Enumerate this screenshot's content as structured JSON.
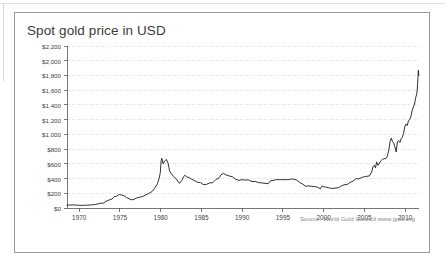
{
  "document": {
    "background_color": "#ffffff",
    "frame_color": "#e2e2e2"
  },
  "card": {
    "border_color": "#9a9a9a",
    "background": "#ffffff"
  },
  "chart_data": {
    "type": "line",
    "title": "Spot gold price in USD",
    "xlabel": "",
    "ylabel": "",
    "source": "Source: World Gold Council www.gold.org",
    "grid": true,
    "grid_color": "#cfcfcf",
    "legend": "none",
    "line_color": "#1a1a1a",
    "axis_color": "#555555",
    "currency_prefix": "$",
    "xlim": [
      1968.5,
      2011.7
    ],
    "ylim": [
      0,
      2200
    ],
    "ytick_labels": [
      "$0",
      "$200",
      "$400",
      "$600",
      "$800",
      "$1,000",
      "$1,200",
      "$1,400",
      "$1,600",
      "$1,800",
      "$2,000",
      "$2,200"
    ],
    "ytick_values": [
      0,
      200,
      400,
      600,
      800,
      1000,
      1200,
      1400,
      1600,
      1800,
      2000,
      2200
    ],
    "xtick_labels": [
      "1970",
      "1975",
      "1980",
      "1985",
      "1990",
      "1995",
      "2000",
      "2005",
      "2010"
    ],
    "xtick_values": [
      1970,
      1975,
      1980,
      1985,
      1990,
      1995,
      2000,
      2005,
      2010
    ],
    "series": [
      {
        "name": "Spot gold price",
        "x": [
          1968.5,
          1969.0,
          1969.5,
          1970.0,
          1970.5,
          1971.0,
          1971.5,
          1972.0,
          1972.5,
          1973.0,
          1973.3,
          1973.6,
          1974.0,
          1974.3,
          1974.6,
          1974.9,
          1975.2,
          1975.5,
          1975.8,
          1976.1,
          1976.4,
          1976.7,
          1977.0,
          1977.4,
          1977.8,
          1978.2,
          1978.6,
          1979.0,
          1979.3,
          1979.6,
          1979.8,
          1979.95,
          1980.05,
          1980.15,
          1980.3,
          1980.5,
          1980.7,
          1980.9,
          1981.1,
          1981.4,
          1981.7,
          1982.0,
          1982.3,
          1982.6,
          1982.8,
          1983.0,
          1983.2,
          1983.5,
          1983.8,
          1984.1,
          1984.5,
          1984.9,
          1985.2,
          1985.6,
          1986.0,
          1986.4,
          1986.8,
          1987.1,
          1987.4,
          1987.7,
          1988.0,
          1988.4,
          1988.8,
          1989.2,
          1989.6,
          1990.0,
          1990.4,
          1990.8,
          1991.2,
          1991.6,
          1992.0,
          1992.4,
          1992.8,
          1993.2,
          1993.5,
          1993.8,
          1994.2,
          1994.6,
          1995.0,
          1995.4,
          1995.8,
          1996.0,
          1996.3,
          1996.7,
          1997.0,
          1997.4,
          1997.8,
          1998.1,
          1998.5,
          1998.9,
          1999.2,
          1999.6,
          1999.8,
          1999.95,
          2000.2,
          2000.6,
          2001.0,
          2001.4,
          2001.8,
          2002.1,
          2002.5,
          2002.9,
          2003.2,
          2003.6,
          2004.0,
          2004.3,
          2004.7,
          2005.0,
          2005.3,
          2005.6,
          2005.9,
          2006.05,
          2006.2,
          2006.35,
          2006.5,
          2006.65,
          2006.8,
          2007.0,
          2007.2,
          2007.4,
          2007.6,
          2007.8,
          2008.0,
          2008.15,
          2008.3,
          2008.45,
          2008.6,
          2008.75,
          2008.9,
          2009.05,
          2009.2,
          2009.35,
          2009.5,
          2009.65,
          2009.8,
          2009.95,
          2010.1,
          2010.25,
          2010.4,
          2010.55,
          2010.7,
          2010.85,
          2011.0,
          2011.15,
          2011.3,
          2011.45,
          2011.55,
          2011.62,
          2011.68
        ],
        "y": [
          38,
          41,
          41,
          36,
          36,
          39,
          42,
          48,
          62,
          68,
          92,
          106,
          120,
          155,
          160,
          183,
          176,
          166,
          142,
          128,
          112,
          116,
          134,
          146,
          157,
          180,
          200,
          230,
          275,
          330,
          400,
          480,
          640,
          675,
          600,
          640,
          660,
          610,
          500,
          450,
          420,
          380,
          335,
          375,
          425,
          445,
          420,
          415,
          390,
          375,
          350,
          345,
          320,
          320,
          340,
          345,
          390,
          400,
          450,
          470,
          450,
          435,
          425,
          390,
          375,
          385,
          380,
          380,
          360,
          360,
          345,
          340,
          335,
          330,
          370,
          375,
          385,
          385,
          385,
          385,
          385,
          395,
          390,
          380,
          350,
          325,
          295,
          300,
          295,
          290,
          285,
          260,
          300,
          290,
          285,
          275,
          265,
          270,
          275,
          295,
          315,
          320,
          345,
          365,
          400,
          395,
          415,
          425,
          430,
          435,
          490,
          560,
          580,
          545,
          625,
          580,
          600,
          640,
          660,
          670,
          670,
          700,
          790,
          900,
          950,
          900,
          880,
          830,
          760,
          900,
          915,
          890,
          940,
          960,
          1010,
          1100,
          1140,
          1120,
          1180,
          1200,
          1240,
          1320,
          1370,
          1410,
          1500,
          1560,
          1720,
          1870,
          1800
        ]
      }
    ]
  }
}
